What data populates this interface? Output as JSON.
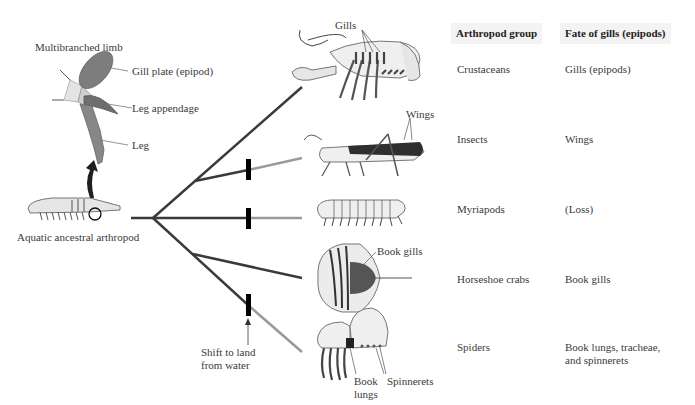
{
  "figure": {
    "limb": {
      "title": "Multibranched limb",
      "labels": [
        "Gill plate (epipod)",
        "Leg appendage",
        "Leg"
      ]
    },
    "ancestor_label": "Aquatic ancestral arthropod",
    "shift_label": [
      "Shift to land",
      "from water"
    ],
    "organism_labels": {
      "crustacean": "Gills",
      "insect": "Wings",
      "horseshoe_crab": "Book gills",
      "spider_book_lungs": [
        "Book",
        "lungs"
      ],
      "spider_spinnerets": "Spinnerets"
    },
    "colors": {
      "branch_dark": "#3a3a3a",
      "branch_land": "#9a9a9a",
      "marker": "#000000",
      "header_bg": "#f3f3f3"
    }
  },
  "table": {
    "headers": [
      "Arthropod group",
      "Fate of gills (epipods)"
    ],
    "rows": [
      {
        "group": "Crustaceans",
        "fate": [
          "Gills (epipods)"
        ]
      },
      {
        "group": "Insects",
        "fate": [
          "Wings"
        ]
      },
      {
        "group": "Myriapods",
        "fate": [
          "(Loss)"
        ]
      },
      {
        "group": "Horseshoe crabs",
        "fate": [
          "Book gills"
        ]
      },
      {
        "group": "Spiders",
        "fate": [
          "Book lungs, tracheae,",
          "and spinnerets"
        ]
      }
    ]
  }
}
